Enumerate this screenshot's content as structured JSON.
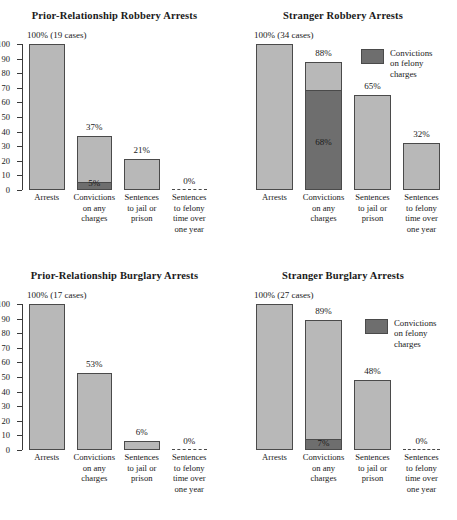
{
  "figure": {
    "legend_label": "Convictions\non felony\ncharges",
    "light_color": "#b8b8b8",
    "dark_color": "#6e6e6e",
    "axis_color": "#4a4a4a"
  },
  "axis": {
    "ticks": [
      100,
      90,
      80,
      70,
      60,
      50,
      40,
      30,
      20,
      10,
      0
    ],
    "min": 0,
    "max": 100
  },
  "categories": [
    "Arrests",
    "Convictions\non any\ncharges",
    "Sentences\nto jail or\nprison",
    "Sentences\nto felony\ntime over\none year"
  ],
  "chart_data": [
    {
      "type": "bar",
      "title": "Prior-Relationship Robbery Arrests",
      "categories": [
        "Arrests",
        "Convictions on any charges",
        "Sentences to jail or prison",
        "Sentences to felony time over one year"
      ],
      "values": [
        100,
        37,
        21,
        0
      ],
      "felony_values": [
        null,
        5,
        null,
        null
      ],
      "labels": [
        "100% (19 cases)",
        "37%",
        "21%",
        "0%"
      ],
      "inner_labels": [
        null,
        "5%",
        null,
        null
      ],
      "xlabel": "",
      "ylabel": "",
      "ylim": [
        0,
        100
      ],
      "legend": "Convictions on felony charges",
      "show_legend": false,
      "n_cases": 19
    },
    {
      "type": "bar",
      "title": "Stranger Robbery Arrests",
      "categories": [
        "Arrests",
        "Convictions on any charges",
        "Sentences to jail or prison",
        "Sentences to felony time over one year"
      ],
      "values": [
        100,
        88,
        65,
        32
      ],
      "felony_values": [
        null,
        68,
        null,
        null
      ],
      "labels": [
        "100% (34 cases)",
        "88%",
        "65%",
        "32%"
      ],
      "inner_labels": [
        null,
        "68%",
        null,
        null
      ],
      "xlabel": "",
      "ylabel": "",
      "ylim": [
        0,
        100
      ],
      "legend": "Convictions on felony charges",
      "show_legend": true,
      "n_cases": 34
    },
    {
      "type": "bar",
      "title": "Prior-Relationship Burglary Arrests",
      "categories": [
        "Arrests",
        "Convictions on any charges",
        "Sentences to jail or prison",
        "Sentences to felony time over one year"
      ],
      "values": [
        100,
        53,
        6,
        0
      ],
      "felony_values": [
        null,
        null,
        null,
        null
      ],
      "labels": [
        "100% (17 cases)",
        "53%",
        "6%",
        "0%"
      ],
      "inner_labels": [
        null,
        null,
        null,
        null
      ],
      "xlabel": "",
      "ylabel": "",
      "ylim": [
        0,
        100
      ],
      "legend": "Convictions on felony charges",
      "show_legend": false,
      "n_cases": 17
    },
    {
      "type": "bar",
      "title": "Stranger Burglary Arrests",
      "categories": [
        "Arrests",
        "Convictions on any charges",
        "Sentences to jail or prison",
        "Sentences to felony time over one year"
      ],
      "values": [
        100,
        89,
        48,
        0
      ],
      "felony_values": [
        null,
        7,
        null,
        null
      ],
      "labels": [
        "100% (27 cases)",
        "89%",
        "48%",
        "0%"
      ],
      "inner_labels": [
        null,
        "7%",
        null,
        null
      ],
      "xlabel": "",
      "ylabel": "",
      "ylim": [
        0,
        100
      ],
      "legend": "Convictions on felony charges",
      "show_legend": true,
      "n_cases": 27
    }
  ]
}
